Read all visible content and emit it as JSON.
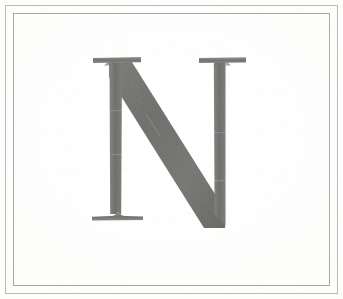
{
  "page": {
    "title": "Letterform Plate",
    "width_px": 343,
    "height_px": 299,
    "background_color": "#fefefe"
  },
  "frame": {
    "style": "double-rule",
    "outer_rule": {
      "inset_px": 5,
      "thickness_px": 1,
      "color": "#b9b9b6"
    },
    "inner_rule": {
      "inset_px": 13,
      "thickness_px": 1,
      "color": "#a8a8a5"
    }
  },
  "artwork": {
    "name": "letter-n-specimen",
    "character": "N",
    "description": "Capital letter N, serif roman letterform, drawn in graphite gray",
    "case": "uppercase",
    "style": "serif",
    "ink_color": "#7b7b79",
    "ink_color_dark": "#6d6d6a",
    "ink_color_light": "#8d8d8a",
    "geometry": {
      "cap_top_y": 70,
      "baseline_y": 229,
      "left_stem_x": [
        119,
        126
      ],
      "right_stem_x": [
        217,
        224
      ],
      "left_serif_x": [
        104,
        143
      ],
      "right_serif_x": [
        203,
        241
      ],
      "foot_serif_x": [
        104,
        146
      ],
      "diagonal_from": [
        122,
        72
      ],
      "diagonal_to": [
        224,
        229
      ],
      "stem_width_px": 6,
      "diagonal_width_px": 21
    }
  },
  "alt_text": "A large gray serif capital letter N centered on a white card with a thin double-line border."
}
